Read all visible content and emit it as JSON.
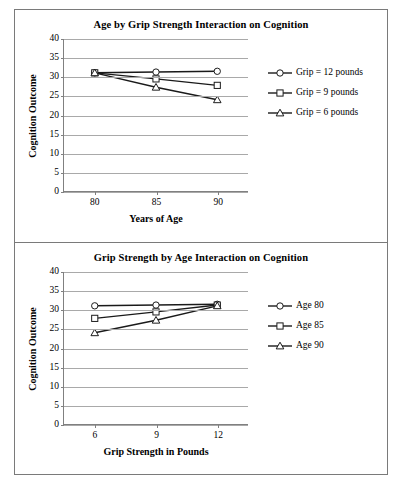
{
  "figure": {
    "panels": [
      "top",
      "bottom"
    ],
    "border_color": "#7a7a7a",
    "gridline_color": "#a9a9a9",
    "series_color": "#1a1a1a"
  },
  "chart_data": [
    {
      "type": "line",
      "panel": "top",
      "title": "Age by Grip Strength Interaction on Cognition",
      "xlabel": "Years of Age",
      "ylabel": "Cognition Outcome",
      "categories": [
        "80",
        "85",
        "90"
      ],
      "x": [
        80,
        85,
        90
      ],
      "xlim": [
        77.5,
        92.5
      ],
      "ylim": [
        0,
        40
      ],
      "yticks": [
        "0",
        "5",
        "10",
        "15",
        "20",
        "25",
        "30",
        "35",
        "40"
      ],
      "grid": true,
      "legend_position": "right",
      "series": [
        {
          "name": "Grip = 12 pounds",
          "marker": "circle",
          "values": [
            31.1,
            31.3,
            31.5
          ]
        },
        {
          "name": "Grip = 9 pounds",
          "marker": "square",
          "values": [
            31.1,
            29.5,
            27.8
          ]
        },
        {
          "name": "Grip = 6 pounds",
          "marker": "triangle",
          "values": [
            31.1,
            27.3,
            24.0
          ]
        }
      ]
    },
    {
      "type": "line",
      "panel": "bottom",
      "title": "Grip Strength by Age Interaction on Cognition",
      "xlabel": "Grip Strength in Pounds",
      "ylabel": "Cognition Outcome",
      "categories": [
        "6",
        "9",
        "12"
      ],
      "x": [
        6,
        9,
        12
      ],
      "xlim": [
        4.5,
        13.5
      ],
      "ylim": [
        0,
        40
      ],
      "yticks": [
        "0",
        "5",
        "10",
        "15",
        "20",
        "25",
        "30",
        "35",
        "40"
      ],
      "grid": true,
      "legend_position": "right",
      "series": [
        {
          "name": "Age 80",
          "marker": "circle",
          "values": [
            31.1,
            31.3,
            31.5
          ]
        },
        {
          "name": "Age 85",
          "marker": "square",
          "values": [
            27.8,
            29.5,
            31.3
          ]
        },
        {
          "name": "Age 90",
          "marker": "triangle",
          "values": [
            24.0,
            27.3,
            31.1
          ]
        }
      ]
    }
  ]
}
